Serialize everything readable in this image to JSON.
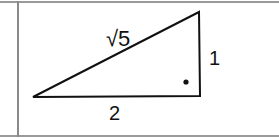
{
  "diagram": {
    "type": "right-triangle",
    "labels": {
      "hypotenuse": "√5",
      "vertical_leg": "1",
      "horizontal_leg": "2"
    },
    "right_angle_marker": "dot",
    "colors": {
      "stroke": "#111111",
      "border": "#9a9a9a"
    }
  }
}
